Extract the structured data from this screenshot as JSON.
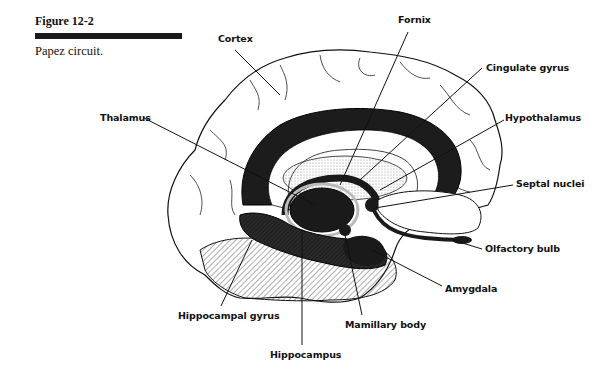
{
  "figure": {
    "number": "Figure 12-2",
    "caption": "Papez circuit."
  },
  "labels": {
    "cortex": "Cortex",
    "fornix": "Fornix",
    "cingulate_gyrus": "Cingulate gyrus",
    "hypothalamus": "Hypothalamus",
    "thalamus": "Thalamus",
    "septal_nuclei": "Septal nuclei",
    "olfactory_bulb": "Olfactory bulb",
    "amygdala": "Amygdala",
    "hippocampal_gyrus": "Hippocampal gyrus",
    "mamillary_body": "Mamillary body",
    "hippocampus": "Hippocampus"
  }
}
